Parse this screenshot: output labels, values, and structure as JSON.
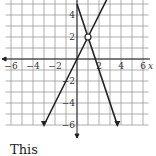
{
  "chart_data": {
    "type": "line",
    "title": "",
    "xlabel": "x",
    "ylabel": "",
    "xlim": [
      -7,
      7
    ],
    "ylim": [
      -6,
      5.5
    ],
    "grid": true,
    "x_ticks": [
      "-6",
      "-4",
      "-2",
      "2",
      "4",
      "6"
    ],
    "y_ticks": [
      "4",
      "2",
      "-2",
      "-4",
      "-6"
    ],
    "series": [
      {
        "name": "y = 2x",
        "points": [
          [
            -3,
            -6
          ],
          [
            1,
            2
          ],
          [
            2.75,
            5.5
          ]
        ]
      },
      {
        "name": "y = -3x + 5",
        "points": [
          [
            0,
            5
          ],
          [
            1,
            2
          ],
          [
            3.67,
            -6
          ]
        ]
      }
    ],
    "annotations": [
      {
        "type": "open-circle",
        "x": 1,
        "y": 2
      }
    ]
  },
  "caption": "This"
}
